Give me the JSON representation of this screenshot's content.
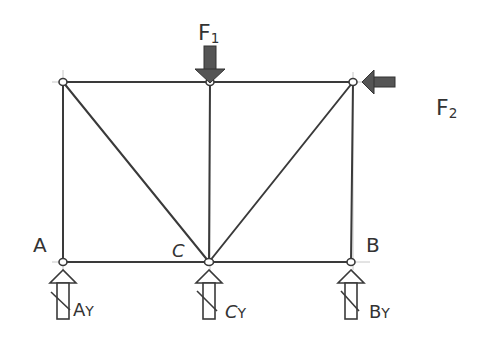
{
  "diagram": {
    "type": "truss",
    "style": "hand-sketched",
    "colors": {
      "line": "#3a3a3a",
      "arrow_fill": "#555555",
      "label": "#333333",
      "construction": "#c8c8c8",
      "background": "#ffffff"
    },
    "nodes": [
      {
        "id": "TL",
        "x": 63,
        "y": 82,
        "label": ""
      },
      {
        "id": "TM",
        "x": 210,
        "y": 82,
        "label": ""
      },
      {
        "id": "TR",
        "x": 353,
        "y": 82,
        "label": ""
      },
      {
        "id": "A",
        "x": 63,
        "y": 262,
        "label": "A"
      },
      {
        "id": "C",
        "x": 209,
        "y": 262,
        "label": "C"
      },
      {
        "id": "B",
        "x": 351,
        "y": 262,
        "label": "B"
      }
    ],
    "members": [
      [
        "TL",
        "TM"
      ],
      [
        "TM",
        "TR"
      ],
      [
        "A",
        "C"
      ],
      [
        "C",
        "B"
      ],
      [
        "TL",
        "A"
      ],
      [
        "TM",
        "C"
      ],
      [
        "TR",
        "B"
      ],
      [
        "TL",
        "C"
      ],
      [
        "TR",
        "C"
      ]
    ],
    "loads": [
      {
        "id": "F1",
        "label": "F",
        "subscript": "1",
        "direction": "down",
        "node": "TM"
      },
      {
        "id": "F2",
        "label": "F",
        "subscript": "2",
        "direction": "left",
        "node": "TR"
      }
    ],
    "reactions": [
      {
        "id": "AY",
        "label": "A",
        "subscript": "Y",
        "direction": "up",
        "node": "A"
      },
      {
        "id": "CY",
        "label": "C",
        "subscript": "Y",
        "direction": "up",
        "node": "C"
      },
      {
        "id": "BY",
        "label": "B",
        "subscript": "Y",
        "direction": "up",
        "node": "B"
      }
    ]
  },
  "labels": {
    "node_a": "A",
    "node_b": "B",
    "node_c": "C",
    "f1_main": "F",
    "f1_sub": "1",
    "f2_main": "F",
    "f2_sub": "2",
    "ay_main": "A",
    "ay_sub": "Y",
    "cy_main": "C",
    "cy_sub": "Y",
    "by_main": "B",
    "by_sub": "Y"
  }
}
